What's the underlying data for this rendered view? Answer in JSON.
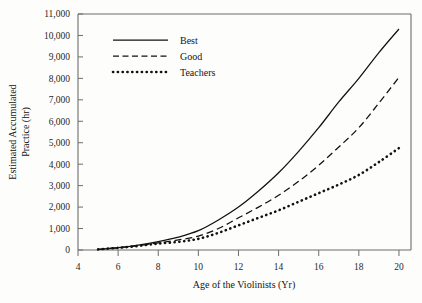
{
  "chart_data": {
    "type": "line",
    "title": "",
    "xlabel": "Age of the Violinists (Yr)",
    "ylabel": "Estimated Accumulated Practice (hr)",
    "ylabel_line1": "Estimated Accumulated",
    "ylabel_line2": "Practice (hr)",
    "xlim": [
      4,
      20.6
    ],
    "ylim": [
      0,
      11000
    ],
    "grid": false,
    "legend_position": "top-left-inside",
    "xticks": [
      4,
      6,
      8,
      10,
      12,
      14,
      16,
      18,
      20
    ],
    "xtick_labels": [
      "4",
      "6",
      "8",
      "10",
      "12",
      "14",
      "16",
      "18",
      "20"
    ],
    "yticks": [
      0,
      1000,
      2000,
      3000,
      4000,
      5000,
      6000,
      7000,
      8000,
      9000,
      10000,
      11000
    ],
    "ytick_labels": [
      "0",
      "1,000",
      "2,000",
      "3,000",
      "4,000",
      "5,000",
      "6,000",
      "7,000",
      "8,000",
      "9,000",
      "10,000",
      "11,000"
    ],
    "x": [
      5,
      6,
      7,
      8,
      9,
      10,
      11,
      12,
      13,
      14,
      15,
      16,
      17,
      18,
      19,
      20
    ],
    "series": [
      {
        "name": "Best",
        "style": "solid",
        "values": [
          30,
          110,
          230,
          390,
          600,
          900,
          1400,
          2000,
          2750,
          3600,
          4600,
          5700,
          6900,
          8000,
          9200,
          10300
        ]
      },
      {
        "name": "Good",
        "style": "dashed",
        "values": [
          30,
          100,
          200,
          330,
          470,
          650,
          1000,
          1500,
          2000,
          2550,
          3200,
          3950,
          4800,
          5700,
          6850,
          8050
        ]
      },
      {
        "name": "Teachers",
        "style": "dotted",
        "values": [
          30,
          100,
          190,
          300,
          380,
          520,
          800,
          1150,
          1500,
          1850,
          2250,
          2650,
          3050,
          3500,
          4100,
          4750
        ]
      }
    ]
  },
  "legend": {
    "items": [
      {
        "label": "Best",
        "style": "solid"
      },
      {
        "label": "Good",
        "style": "dashed"
      },
      {
        "label": "Teachers",
        "style": "dotted"
      }
    ]
  },
  "colors": {
    "line": "#111111",
    "axis": "#6d6d6d",
    "background": "#fdfdfc",
    "text": "#141414"
  }
}
